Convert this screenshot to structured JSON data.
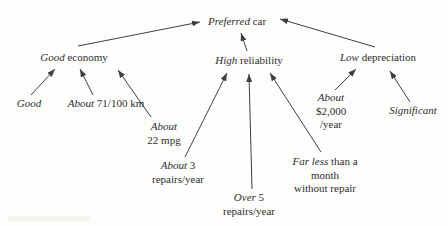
{
  "diagram": {
    "title_node": "Preferred car",
    "nodes": {
      "preferred": {
        "em": "Preferred",
        "rest": " car"
      },
      "economy": {
        "em": "Good",
        "rest": " economy"
      },
      "reliability": {
        "em": "High",
        "rest": " reliability"
      },
      "depreciation": {
        "em": "Low",
        "rest": " depreciation"
      },
      "good": {
        "em": "Good"
      },
      "l100km": {
        "em": "About",
        "rest": " 71/100 km"
      },
      "mpg": {
        "em": "About",
        "line2": "22 mpg"
      },
      "repairs3": {
        "em": "About",
        "rest": " 3",
        "line2": "repairs/year"
      },
      "repairs5": {
        "em": "Over",
        "rest": " 5",
        "line2": "repairs/year"
      },
      "farless": {
        "em": "Far less",
        "rest": " than a",
        "line2": "month",
        "line3": "without repair"
      },
      "cost": {
        "em": "About",
        "line2": "$2,000",
        "line3": "/year"
      },
      "significant": {
        "em": "Significant"
      }
    },
    "edges": [
      {
        "from": "good-economy",
        "to": "preferred-car"
      },
      {
        "from": "high-reliability",
        "to": "preferred-car"
      },
      {
        "from": "low-depreciation",
        "to": "preferred-car"
      },
      {
        "from": "good",
        "to": "good-economy"
      },
      {
        "from": "about-71-100-km",
        "to": "good-economy"
      },
      {
        "from": "about-22-mpg",
        "to": "good-economy"
      },
      {
        "from": "about-3-repairs-year",
        "to": "high-reliability"
      },
      {
        "from": "over-5-repairs-year",
        "to": "high-reliability"
      },
      {
        "from": "far-less-than-a-month-without-repair",
        "to": "high-reliability"
      },
      {
        "from": "about-2000-year",
        "to": "low-depreciation"
      },
      {
        "from": "significant",
        "to": "low-depreciation"
      }
    ],
    "colors": {
      "ink": "#2e2e2e",
      "line": "#3f3f3f",
      "background": "#fdfdfc"
    }
  }
}
